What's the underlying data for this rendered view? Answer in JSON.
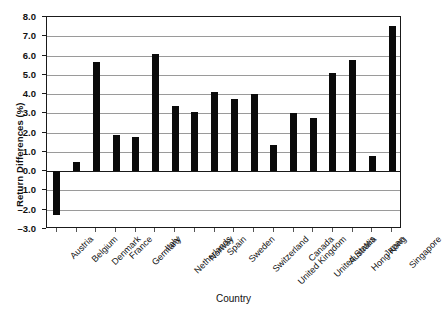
{
  "chart_data": {
    "type": "bar",
    "title": "",
    "xlabel": "Country",
    "ylabel": "Return Differences (%)",
    "categories": [
      "Austria",
      "Belgium",
      "Denmark",
      "France",
      "Germany",
      "Italy",
      "Netherlands",
      "Norway",
      "Spain",
      "Sweden",
      "Switzerland",
      "United Kingdom",
      "Canada",
      "United States",
      "Australia",
      "Hong Kong",
      "Japan",
      "Singapore"
    ],
    "values": [
      -2.25,
      0.5,
      5.65,
      1.9,
      1.75,
      6.1,
      3.4,
      3.05,
      4.1,
      3.75,
      4.0,
      1.35,
      3.0,
      2.75,
      5.1,
      5.75,
      0.8,
      7.55
    ],
    "ylim": [
      -3.0,
      8.0
    ],
    "ytick_labels": [
      "8.0",
      "7.0",
      "6.0",
      "5.0",
      "4.0",
      "3.0",
      "2.0",
      "1.0",
      "0.0",
      "-1.0",
      "-2.0",
      "-3.0"
    ],
    "ytick_values": [
      8,
      7,
      6,
      5,
      4,
      3,
      2,
      1,
      0,
      -1,
      -2,
      -3
    ],
    "grid": true,
    "legend": "none",
    "bar_color": "#0a0a0a",
    "grid_color": "#9a9a9a",
    "axis_color": "#1a1a1a"
  }
}
